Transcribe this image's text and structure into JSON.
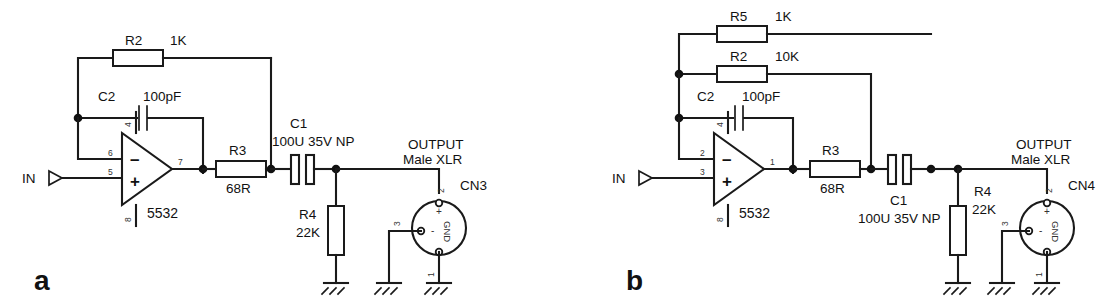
{
  "figure": {
    "background": "#ffffff",
    "ink": "#1a1a1a"
  },
  "panels": [
    {
      "id": "a",
      "label": "a",
      "input": {
        "label": "IN",
        "port_icon": "input-port-triangle"
      },
      "opamp": {
        "type": "5532",
        "pin_inverting": "6",
        "pin_noninverting": "5",
        "pin_output": "7",
        "pin_vplus": "4",
        "pin_vminus": "8",
        "sign_minus": "–",
        "sign_plus": "+"
      },
      "components": [
        {
          "ref": "R2",
          "value": "1K",
          "kind": "resistor"
        },
        {
          "ref": "C2",
          "value": "100pF",
          "kind": "capacitor"
        },
        {
          "ref": "R3",
          "value": "68R",
          "kind": "resistor"
        },
        {
          "ref": "C1",
          "value": "100U 35V NP",
          "kind": "capacitor"
        },
        {
          "ref": "R4",
          "value": "22K",
          "kind": "resistor"
        }
      ],
      "connector": {
        "title_line1": "OUTPUT",
        "title_line2": "Male XLR",
        "ref": "CN3",
        "pin_hot": "2",
        "pin_cold": "3",
        "pin_ground": "1",
        "pin_hot_mark": "+",
        "pin_cold_mark": "-",
        "ground_text": "GND"
      }
    },
    {
      "id": "b",
      "label": "b",
      "input": {
        "label": "IN",
        "port_icon": "input-port-triangle"
      },
      "opamp": {
        "type": "5532",
        "pin_inverting": "2",
        "pin_noninverting": "3",
        "pin_output": "1",
        "pin_vplus": "4",
        "pin_vminus": "8",
        "sign_minus": "–",
        "sign_plus": "+"
      },
      "components": [
        {
          "ref": "R5",
          "value": "1K",
          "kind": "resistor"
        },
        {
          "ref": "R2",
          "value": "10K",
          "kind": "resistor"
        },
        {
          "ref": "C2",
          "value": "100pF",
          "kind": "capacitor"
        },
        {
          "ref": "R3",
          "value": "68R",
          "kind": "resistor"
        },
        {
          "ref": "C1",
          "value": "100U 35V NP",
          "kind": "capacitor"
        },
        {
          "ref": "R4",
          "value": "22K",
          "kind": "resistor"
        }
      ],
      "connector": {
        "title_line1": "OUTPUT",
        "title_line2": "Male XLR",
        "ref": "CN4",
        "pin_hot": "2",
        "pin_cold": "3",
        "pin_ground": "1",
        "pin_hot_mark": "+",
        "pin_cold_mark": "-",
        "ground_text": "GND"
      }
    }
  ]
}
